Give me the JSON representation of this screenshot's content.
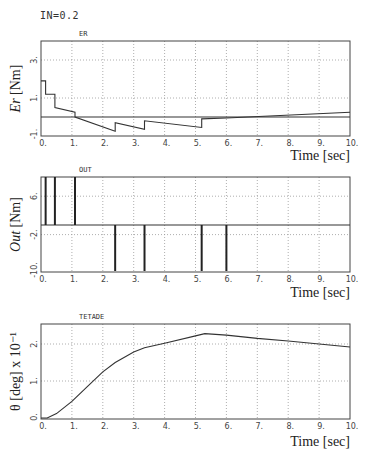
{
  "header": {
    "param_label": "IN=0.2"
  },
  "plots": [
    {
      "title": "ER",
      "ylabel": "Er [Nm]",
      "xlabel": "Time [sec]",
      "yticks": [
        "3.",
        "1.",
        "-1."
      ]
    },
    {
      "title": "OUT",
      "ylabel": "Out [Nm]",
      "xlabel": "Time [sec]",
      "yticks": [
        "6.",
        "-2.",
        "-10."
      ]
    },
    {
      "title": "TETADE",
      "ylabel": "θ [deg] x 10⁻¹",
      "xlabel": "Time [sec]",
      "yticks": [
        "2.",
        "1.",
        "0."
      ]
    }
  ],
  "xticks": [
    "0.",
    "1.",
    "2.",
    "3.",
    "4.",
    "5.",
    "6.",
    "7.",
    "8.",
    "9.",
    "10."
  ],
  "chart_data": [
    {
      "type": "line",
      "title": "ER",
      "xlabel": "Time [sec]",
      "ylabel": "Er [Nm]",
      "xlim": [
        0,
        10
      ],
      "ylim": [
        -1,
        4
      ],
      "grid": true,
      "x": [
        0,
        0.15,
        0.15,
        0.45,
        0.45,
        1.1,
        1.1,
        2.4,
        2.4,
        3.35,
        3.35,
        5.2,
        5.2,
        6.0,
        10
      ],
      "values": [
        1.9,
        1.9,
        1.2,
        1.2,
        0.5,
        0.25,
        0.0,
        -0.75,
        -0.3,
        -0.65,
        -0.2,
        -0.55,
        -0.1,
        -0.05,
        0.25
      ],
      "reference_line": 0
    },
    {
      "type": "line",
      "title": "OUT",
      "xlabel": "Time [sec]",
      "ylabel": "Out [Nm]",
      "xlim": [
        0,
        10
      ],
      "ylim": [
        -10,
        10
      ],
      "grid": true,
      "baseline": 0,
      "spikes": [
        {
          "t": 0.15,
          "value": 10
        },
        {
          "t": 0.45,
          "value": 10
        },
        {
          "t": 1.1,
          "value": 10
        },
        {
          "t": 2.4,
          "value": -10
        },
        {
          "t": 3.35,
          "value": -10
        },
        {
          "t": 5.2,
          "value": -10
        },
        {
          "t": 6.0,
          "value": -10
        }
      ]
    },
    {
      "type": "line",
      "title": "TETADE",
      "xlabel": "Time [sec]",
      "ylabel": "θ [deg] x 10⁻¹",
      "xlim": [
        0,
        10
      ],
      "ylim": [
        0,
        2.5
      ],
      "grid": true,
      "x": [
        0,
        0.2,
        0.5,
        1.0,
        1.5,
        2.0,
        2.4,
        3.0,
        3.35,
        4.0,
        5.0,
        5.3,
        6.0,
        7.0,
        8.0,
        9.0,
        10.0
      ],
      "values": [
        0,
        0.0,
        0.12,
        0.45,
        0.85,
        1.25,
        1.5,
        1.78,
        1.9,
        2.02,
        2.22,
        2.28,
        2.24,
        2.15,
        2.08,
        2.0,
        1.92
      ]
    }
  ]
}
